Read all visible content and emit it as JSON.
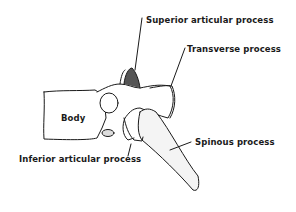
{
  "diagram": {
    "labels": {
      "superior": "Superior articular process",
      "transverse": "Transverse process",
      "body": "Body",
      "spinous": "Spinous process",
      "inferior": "Inferior articular process"
    },
    "colors": {
      "line": "#1a1a1a",
      "background": "#ffffff"
    }
  }
}
